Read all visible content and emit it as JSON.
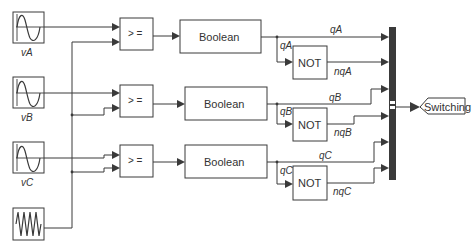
{
  "diagram": {
    "sources": [
      {
        "id": "vA",
        "label": "vA",
        "type": "sine-wave"
      },
      {
        "id": "vB",
        "label": "vB",
        "type": "sine-wave"
      },
      {
        "id": "vC",
        "label": "vC",
        "type": "sine-wave"
      },
      {
        "id": "carrier",
        "label": "",
        "type": "triangle-wave"
      }
    ],
    "comparators": [
      {
        "id": "cmpA",
        "label": "> ="
      },
      {
        "id": "cmpB",
        "label": "> ="
      },
      {
        "id": "cmpC",
        "label": "> ="
      }
    ],
    "converters": [
      {
        "id": "boolA",
        "label": "Boolean"
      },
      {
        "id": "boolB",
        "label": "Boolean"
      },
      {
        "id": "boolC",
        "label": "Boolean"
      }
    ],
    "inverters": [
      {
        "id": "notA",
        "label": "NOT"
      },
      {
        "id": "notB",
        "label": "NOT"
      },
      {
        "id": "notC",
        "label": "NOT"
      }
    ],
    "signals": {
      "qA_top": "qA",
      "qA_branch": "qA",
      "nqA": "nqA",
      "qB_top": "qB",
      "qB_branch": "qB",
      "nqB": "nqB",
      "qC_top": "qC",
      "qC_branch": "qC",
      "nqC": "nqC"
    },
    "output_tag": {
      "label": "Switching"
    },
    "colors": {
      "line": "#3a3a3a",
      "mux": "#3a3a3a",
      "background": "#ffffff"
    }
  }
}
